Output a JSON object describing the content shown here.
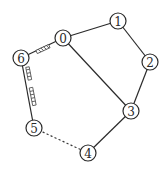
{
  "diagram": {
    "type": "graph",
    "nodes": [
      {
        "id": "0",
        "label": "0",
        "x": 63,
        "y": 38
      },
      {
        "id": "1",
        "label": "1",
        "x": 118,
        "y": 21
      },
      {
        "id": "2",
        "label": "2",
        "x": 150,
        "y": 62
      },
      {
        "id": "3",
        "label": "3",
        "x": 131,
        "y": 111
      },
      {
        "id": "4",
        "label": "4",
        "x": 88,
        "y": 153
      },
      {
        "id": "5",
        "label": "5",
        "x": 34,
        "y": 128
      },
      {
        "id": "6",
        "label": "6",
        "x": 21,
        "y": 58
      }
    ],
    "edges": [
      {
        "from": "0",
        "to": "1",
        "style": "solid"
      },
      {
        "from": "1",
        "to": "2",
        "style": "solid"
      },
      {
        "from": "2",
        "to": "3",
        "style": "solid"
      },
      {
        "from": "0",
        "to": "3",
        "style": "solid"
      },
      {
        "from": "3",
        "to": "4",
        "style": "solid"
      },
      {
        "from": "4",
        "to": "5",
        "style": "dotted"
      },
      {
        "from": "5",
        "to": "6",
        "style": "solid",
        "markers": 2
      },
      {
        "from": "6",
        "to": "0",
        "style": "solid",
        "markers": 1
      }
    ],
    "node_radius": 8,
    "colors": {
      "stroke": "#2a2a2a",
      "fill": "#ffffff",
      "background": "#ffffff"
    }
  }
}
